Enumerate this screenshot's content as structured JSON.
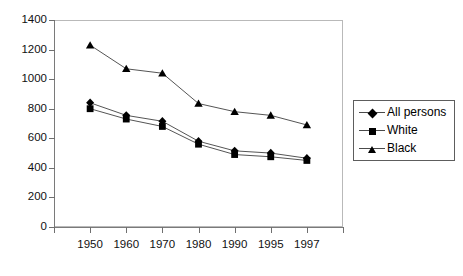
{
  "chart_data": {
    "type": "line",
    "title": "",
    "subtitle": "",
    "xlabel": "",
    "ylabel": "",
    "categories": [
      "1950",
      "1960",
      "1970",
      "1980",
      "1990",
      "1995",
      "1997"
    ],
    "series": [
      {
        "name": "All persons",
        "marker": "diamond",
        "values": [
          840,
          755,
          715,
          580,
          515,
          500,
          465
        ]
      },
      {
        "name": "White",
        "marker": "square",
        "values": [
          800,
          730,
          680,
          560,
          490,
          475,
          450
        ]
      },
      {
        "name": "Black",
        "marker": "triangle",
        "values": [
          1230,
          1070,
          1040,
          835,
          780,
          755,
          690
        ]
      }
    ],
    "ylim": [
      0,
      1400
    ],
    "yticks": [
      0,
      200,
      400,
      600,
      800,
      1000,
      1200,
      1400
    ],
    "ytick_labels": [
      "0",
      "200",
      "400",
      "600",
      "800",
      "1000",
      "1200",
      "1400"
    ],
    "grid": false,
    "legend_position": "right",
    "colors": {
      "series": "#000000",
      "axis": "#7a7a7a",
      "frame": "#b9b9b9",
      "background": "#ffffff",
      "text": "#000000"
    }
  },
  "legend": {
    "items": [
      {
        "label": "All persons",
        "icon": "diamond-marker-icon"
      },
      {
        "label": "White",
        "icon": "square-marker-icon"
      },
      {
        "label": "Black",
        "icon": "triangle-marker-icon"
      }
    ]
  }
}
